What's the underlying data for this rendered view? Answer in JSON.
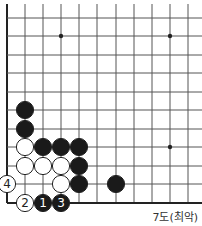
{
  "diagram": {
    "caption": "7도(최악)",
    "grid": {
      "x_lines": [
        7,
        25,
        43,
        61,
        79,
        97,
        116,
        134,
        152,
        170,
        188
      ],
      "y_lines": [
        18,
        36,
        55,
        73,
        92,
        110,
        129,
        147,
        166,
        184,
        203
      ],
      "left_edge_x": 7,
      "bottom_edge_y": 203
    },
    "star_points": [
      {
        "x": 61,
        "y": 36
      },
      {
        "x": 170,
        "y": 36
      },
      {
        "x": 170,
        "y": 147
      }
    ],
    "stones": [
      {
        "color": "black",
        "x": 25,
        "y": 110,
        "label": ""
      },
      {
        "color": "black",
        "x": 25,
        "y": 129,
        "label": ""
      },
      {
        "color": "white",
        "x": 25,
        "y": 147,
        "label": ""
      },
      {
        "color": "black",
        "x": 43,
        "y": 147,
        "label": ""
      },
      {
        "color": "black",
        "x": 61,
        "y": 147,
        "label": ""
      },
      {
        "color": "black",
        "x": 79,
        "y": 147,
        "label": ""
      },
      {
        "color": "white",
        "x": 25,
        "y": 166,
        "label": ""
      },
      {
        "color": "white",
        "x": 43,
        "y": 166,
        "label": ""
      },
      {
        "color": "white",
        "x": 61,
        "y": 166,
        "label": ""
      },
      {
        "color": "black",
        "x": 79,
        "y": 166,
        "label": ""
      },
      {
        "color": "white",
        "x": 7,
        "y": 184,
        "label": "4"
      },
      {
        "color": "white",
        "x": 61,
        "y": 184,
        "label": ""
      },
      {
        "color": "black",
        "x": 79,
        "y": 184,
        "label": ""
      },
      {
        "color": "black",
        "x": 116,
        "y": 184,
        "label": ""
      },
      {
        "color": "white",
        "x": 25,
        "y": 203,
        "label": "2"
      },
      {
        "color": "black",
        "x": 43,
        "y": 203,
        "label": "1"
      },
      {
        "color": "black",
        "x": 61,
        "y": 203,
        "label": "3"
      }
    ],
    "colors": {
      "line": "#555555",
      "edge": "#222222",
      "black_stone": "#1a1a1a",
      "white_stone": "#ffffff",
      "stone_outline": "#222222"
    }
  }
}
